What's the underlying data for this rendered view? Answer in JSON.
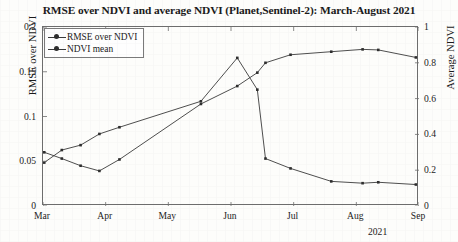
{
  "chart_data": {
    "type": "line",
    "title": "RMSE over NDVI and average NDVI (Planet,Sentinel-2): March-August 2021",
    "xlabel": "2021",
    "ylabel": "RMSE over NDVI",
    "y2label": "Average NDVI",
    "xtick_labels": [
      "Mar",
      "Apr",
      "May",
      "Jun",
      "Jul",
      "Aug",
      "Sep"
    ],
    "ytick_labels_left": [
      "0",
      "0.05",
      "0.1",
      "0.15",
      "0.2"
    ],
    "ytick_labels_right": [
      "0",
      "0.2",
      "0.4",
      "0.6",
      "0.8",
      "1"
    ],
    "ylim": [
      0,
      0.2
    ],
    "y2lim": [
      0,
      1
    ],
    "xlim": [
      0,
      6
    ],
    "grid": false,
    "legend_position": "upper left",
    "series": [
      {
        "name": "RMSE over NDVI",
        "axis": "left",
        "x": [
          0.02,
          0.3,
          0.6,
          0.9,
          1.22,
          2.52,
          3.1,
          3.42,
          3.55,
          3.95,
          4.6,
          5.1,
          5.35,
          5.95
        ],
        "values": [
          0.0485,
          0.0625,
          0.068,
          0.0805,
          0.088,
          0.117,
          0.1655,
          0.13,
          0.053,
          0.042,
          0.0275,
          0.0255,
          0.0265,
          0.024
        ]
      },
      {
        "name": "NDVI mean",
        "axis": "right",
        "x": [
          0.02,
          0.3,
          0.6,
          0.9,
          1.22,
          2.52,
          3.1,
          3.42,
          3.55,
          3.95,
          4.6,
          5.1,
          5.35,
          5.95
        ],
        "values": [
          0.3,
          0.265,
          0.225,
          0.196,
          0.26,
          0.57,
          0.67,
          0.745,
          0.8,
          0.845,
          0.862,
          0.875,
          0.872,
          0.83
        ]
      }
    ]
  },
  "legend": {
    "items": [
      {
        "label": "RMSE over NDVI"
      },
      {
        "label": "NDVI mean"
      }
    ]
  },
  "style": {
    "line_color": "#3a3a3a",
    "marker_color": "#2e2e2e",
    "axis_color": "#6d6d6d",
    "text_color": "#1a1a1a"
  }
}
